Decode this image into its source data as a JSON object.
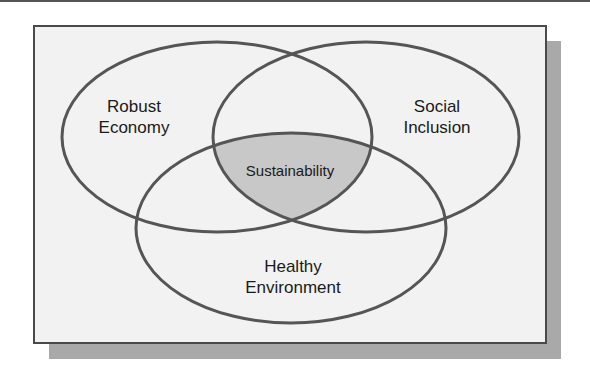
{
  "diagram": {
    "type": "venn",
    "sets": [
      {
        "id": "economy",
        "line1": "Robust",
        "line2": "Economy"
      },
      {
        "id": "social",
        "line1": "Social",
        "line2": "Inclusion"
      },
      {
        "id": "environment",
        "line1": "Healthy",
        "line2": "Environment"
      }
    ],
    "intersection": {
      "label": "Sustainability",
      "fill": "#c8c8c8"
    },
    "colors": {
      "stroke": "#555555",
      "background": "#f2f2f2",
      "shadow": "#a9a9a9"
    }
  }
}
